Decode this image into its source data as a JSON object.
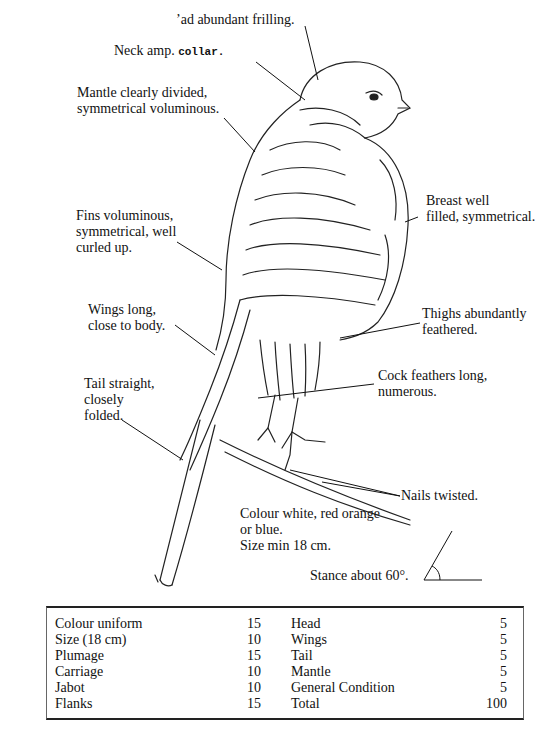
{
  "labels": {
    "head": "ʼad abundant frilling.",
    "neck_prefix": "Neck amp.",
    "neck_suffix": "collar.",
    "mantle_1": "Mantle clearly divided,",
    "mantle_2": "symmetrical voluminous.",
    "breast_1": "Breast well",
    "breast_2": "filled, symmetrical.",
    "fins_1": "Fins voluminous,",
    "fins_2": "symmetrical, well",
    "fins_3": "curled up.",
    "thighs_1": "Thighs abundantly",
    "thighs_2": "feathered.",
    "wings_1": "Wings long,",
    "wings_2": "close to body.",
    "cock_1": "Cock feathers long,",
    "cock_2": "numerous.",
    "tail_1": "Tail straight,",
    "tail_2": "closely",
    "tail_3": "folded.",
    "nails": "Nails twisted.",
    "colour_1": "Colour white, red orange",
    "colour_2": "or blue.",
    "colour_3": "Size min 18 cm.",
    "stance": "Stance about 60°."
  },
  "score_table": {
    "rows": [
      {
        "left_label": "Colour uniform",
        "left_points": "15",
        "right_label": "Head",
        "right_points": "5"
      },
      {
        "left_label": "Size (18 cm)",
        "left_points": "10",
        "right_label": "Wings",
        "right_points": "5"
      },
      {
        "left_label": "Plumage",
        "left_points": "15",
        "right_label": "Tail",
        "right_points": "5"
      },
      {
        "left_label": "Carriage",
        "left_points": "10",
        "right_label": "Mantle",
        "right_points": "5"
      },
      {
        "left_label": "Jabot",
        "left_points": "10",
        "right_label": "General Condition",
        "right_points": "5"
      },
      {
        "left_label": "Flanks",
        "left_points": "15",
        "right_label": "Total",
        "right_points": "100"
      }
    ]
  }
}
